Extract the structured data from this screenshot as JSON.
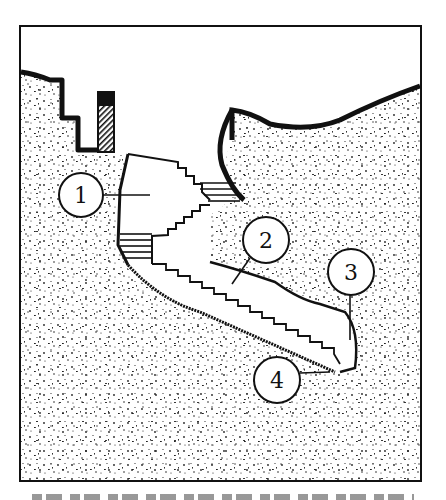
{
  "figure": {
    "type": "cross-section diagram",
    "frame": {
      "x": 20,
      "y": 26,
      "width": 401,
      "height": 455
    },
    "colors": {
      "ink": "#111111",
      "paper": "#ffffff",
      "soil_speckle": "#222222"
    }
  },
  "callouts": [
    {
      "id": "1",
      "label": "1",
      "cx": 81,
      "cy": 195,
      "r": 22,
      "leader_to": [
        150,
        195
      ]
    },
    {
      "id": "2",
      "label": "2",
      "cx": 266,
      "cy": 240,
      "r": 23,
      "leader_to": [
        232,
        284
      ]
    },
    {
      "id": "3",
      "label": "3",
      "cx": 351,
      "cy": 272,
      "r": 23,
      "leader_to": [
        350,
        340
      ]
    },
    {
      "id": "4",
      "label": "4",
      "cx": 277,
      "cy": 380,
      "r": 23,
      "leader_to": [
        330,
        372
      ]
    }
  ],
  "caption": {
    "visible": "partially cropped, illegible"
  }
}
